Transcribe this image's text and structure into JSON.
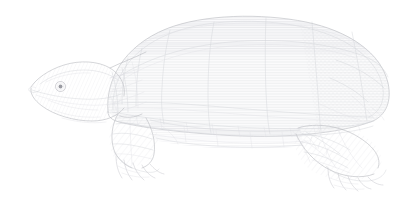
{
  "figure": {
    "kind": "scientific-line-illustration",
    "subject": "turtle",
    "common_name": "Turtle",
    "orientation": "left-facing profile",
    "technique": "engraved stipple and hatch line art",
    "caption": "",
    "title": "",
    "visible_text": [],
    "canvas": {
      "width": 417,
      "height": 202,
      "background_color": "#ffffff"
    },
    "palette": {
      "background": "#ffffff",
      "outline": "#c2c3c8",
      "outline_strong": "#b9bac0",
      "hatch": "#d6d7dc",
      "faint": "#e0e1e5",
      "eye": "#9a9ba2"
    },
    "subject_bbox": {
      "x": 28,
      "y": 18,
      "width": 362,
      "height": 170
    },
    "parts": [
      {
        "name": "carapace",
        "label": "Carapace (upper shell)",
        "bbox": {
          "x": 105,
          "y": 18,
          "width": 285,
          "height": 110
        }
      },
      {
        "name": "vertebral-scutes",
        "label": "Vertebral scutes",
        "count": 5
      },
      {
        "name": "costal-scutes",
        "label": "Costal scutes",
        "count": 4
      },
      {
        "name": "marginal-scutes",
        "label": "Marginal scutes",
        "count": 11
      },
      {
        "name": "head",
        "label": "Head",
        "bbox": {
          "x": 28,
          "y": 60,
          "width": 85,
          "height": 62
        }
      },
      {
        "name": "eye",
        "label": "Eye",
        "bbox": {
          "x": 56,
          "y": 82,
          "width": 10,
          "height": 9
        }
      },
      {
        "name": "neck",
        "label": "Neck",
        "bbox": {
          "x": 85,
          "y": 62,
          "width": 45,
          "height": 58
        }
      },
      {
        "name": "foreleg",
        "label": "Front limb",
        "bbox": {
          "x": 108,
          "y": 112,
          "width": 55,
          "height": 70
        }
      },
      {
        "name": "forefoot-claws",
        "label": "Front foot claws",
        "count": 5
      },
      {
        "name": "hindleg",
        "label": "Hind limb",
        "bbox": {
          "x": 290,
          "y": 118,
          "width": 100,
          "height": 68
        }
      },
      {
        "name": "hindfoot-claws",
        "label": "Hind foot claws",
        "count": 5
      },
      {
        "name": "plastron-bridge",
        "label": "Plastron bridge",
        "bbox": {
          "x": 150,
          "y": 110,
          "width": 160,
          "height": 36
        }
      }
    ]
  }
}
